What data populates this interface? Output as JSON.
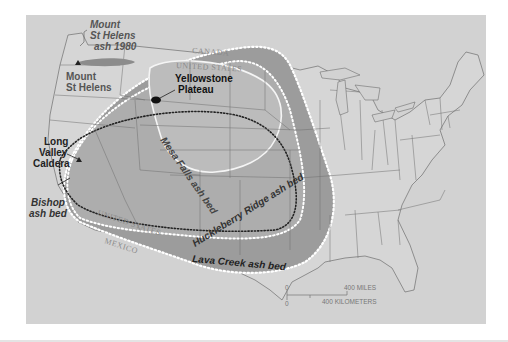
{
  "map": {
    "title": "Yellowstone and related volcanic ash beds",
    "colors": {
      "background": "#d2d2d2",
      "lava_creek_fill": "#9a9a9a",
      "huckleberry_fill": "#adadad",
      "mesa_falls_fill": "#bdbdbd",
      "state_lines": "#6e6e6e",
      "boundary_white_dotted": "#ffffff",
      "boundary_black_dotted": "#222222",
      "label_dark": "#111111",
      "label_grey": "#555555",
      "st_helens_ash": "#8c8c8c"
    },
    "labels": {
      "st_helens_ash": [
        "Mount",
        "St Helens",
        "ash 1980"
      ],
      "st_helens": [
        "Mount",
        "St Helens"
      ],
      "yellowstone": [
        "Yellowstone",
        "Plateau"
      ],
      "long_valley": [
        "Long",
        "Valley",
        "Caldera"
      ],
      "bishop": [
        "Bishop",
        "ash bed"
      ],
      "mesa_falls": "Mesa Falls ash bed",
      "huckleberry": "Huckleberry Ridge ash bed",
      "lava_creek": "Lava Creek ash bed",
      "canada": "CANADA",
      "united_states_north": "UNITED STATES",
      "united_states_south": "UNITED STATES",
      "mexico": "MEXICO"
    },
    "scale_bar": {
      "zero_top": "0",
      "zero_bottom": "0",
      "miles": "400 MILES",
      "kilometers": "400 KILOMETERS"
    },
    "icons": {
      "volcano_marker": "triangle",
      "yellowstone_marker": "black-blob"
    }
  }
}
